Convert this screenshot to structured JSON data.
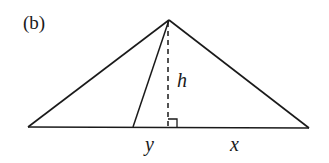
{
  "figure": {
    "panel_label": "(b)",
    "labels": {
      "height": "h",
      "left_segment": "y",
      "right_segment": "x"
    },
    "colors": {
      "stroke": "#1a1a1a",
      "background": "#ffffff"
    },
    "points": {
      "apex": [
        169,
        20
      ],
      "base_left": [
        28,
        127
      ],
      "base_right": [
        309,
        128
      ],
      "inner_foot": [
        133,
        127
      ],
      "altitude_foot": [
        168,
        127
      ]
    }
  }
}
